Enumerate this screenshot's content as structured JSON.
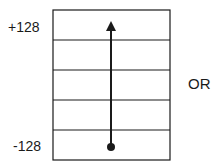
{
  "diagram": {
    "scale_max_label": "+128",
    "scale_min_label": "-128",
    "connector_text": "OR",
    "scale": {
      "min": -128,
      "max": 128,
      "rows": 5
    },
    "arrow": {
      "from": -128,
      "to": 128,
      "direction": "up"
    },
    "colors": {
      "stroke": "#1a1a1a",
      "background": "#ffffff"
    }
  }
}
